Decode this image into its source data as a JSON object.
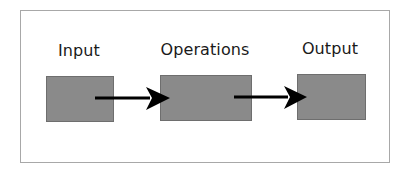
{
  "diagram": {
    "type": "flow",
    "nodes": [
      {
        "id": "input",
        "label": "Input"
      },
      {
        "id": "operations",
        "label": "Operations"
      },
      {
        "id": "output",
        "label": "Output"
      }
    ],
    "edges": [
      {
        "from": "input",
        "to": "operations"
      },
      {
        "from": "operations",
        "to": "output"
      }
    ],
    "colors": {
      "box_fill": "#8a8a8a",
      "box_border": "#6e6e6e",
      "arrow": "#000000",
      "frame_border": "#a8a8a8",
      "text": "#1a1a1a"
    }
  }
}
